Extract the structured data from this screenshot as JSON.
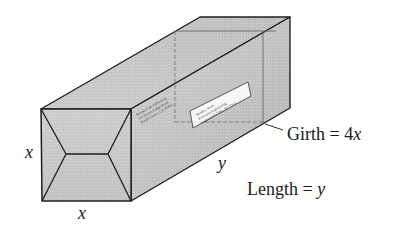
{
  "figure": {
    "colors": {
      "background": "#ffffff",
      "edge": "#1e1e1e",
      "front_face": "#c9c9c9",
      "top_face": "#d6d6d6",
      "side_face": "#bdbdbd",
      "label_fill": "#f7f7f7",
      "girth_line": "#7a7a7a"
    }
  },
  "labels": {
    "front_height": "x",
    "front_width": "x",
    "side_length": "y",
    "girth_word": "Girth",
    "girth_equals": " = 4",
    "girth_var": "x",
    "length_word": "Length",
    "length_equals": " = ",
    "length_var": "y"
  },
  "package": {
    "return_address_lines": [
      "Brooks/Cole Publishing",
      "511 Forest Lodge Road",
      "Pacific Grove, CA 93950"
    ],
    "shipping_label_lines": [
      "Bradley Jones",
      "Precision Engineering",
      "Englewood Cliffs, NJ 07632"
    ]
  }
}
